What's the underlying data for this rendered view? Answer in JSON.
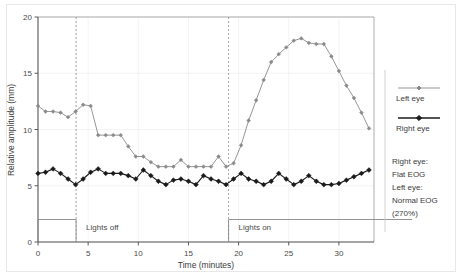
{
  "chart_data": {
    "type": "line",
    "title": "",
    "xlabel": "Time (minutes)",
    "ylabel": "Relative amplitude (mm)",
    "xlim": [
      0,
      33.5
    ],
    "ylim": [
      0,
      20
    ],
    "xticks": [
      0,
      5,
      10,
      15,
      20,
      25,
      30
    ],
    "yticks": [
      0,
      5,
      10,
      15,
      20
    ],
    "grid": true,
    "legend_position": "right",
    "series": [
      {
        "name": "Left eye",
        "color": "#8a8a8a",
        "marker": "diamond",
        "x": [
          0,
          0.75,
          1.5,
          2.25,
          3,
          3.75,
          4.5,
          5.25,
          6,
          6.75,
          7.5,
          8.25,
          9,
          9.75,
          10.5,
          11.25,
          12,
          12.75,
          13.5,
          14.25,
          15,
          15.75,
          16.5,
          17.25,
          18,
          18.75,
          19.5,
          20.25,
          21,
          21.75,
          22.5,
          23.25,
          24,
          24.75,
          25.5,
          26.25,
          27,
          27.75,
          28.5,
          29.25,
          30,
          30.75,
          31.5,
          32.25,
          33
        ],
        "y": [
          12.1,
          11.6,
          11.6,
          11.5,
          11.1,
          11.6,
          12.2,
          12.1,
          9.5,
          9.5,
          9.5,
          9.5,
          8.5,
          7.6,
          7.6,
          7.1,
          6.7,
          6.7,
          6.7,
          7.3,
          6.7,
          6.7,
          6.7,
          6.7,
          7.6,
          6.7,
          7.0,
          8.6,
          10.8,
          12.6,
          14.4,
          16.0,
          16.7,
          17.3,
          17.9,
          18.1,
          17.7,
          17.6,
          17.6,
          16.5,
          15.2,
          13.9,
          12.8,
          11.5,
          10.1
        ]
      },
      {
        "name": "Right eye",
        "color": "#1a1a1a",
        "marker": "diamond",
        "x": [
          0,
          0.75,
          1.5,
          2.25,
          3,
          3.75,
          4.5,
          5.25,
          6,
          6.75,
          7.5,
          8.25,
          9,
          9.75,
          10.5,
          11.25,
          12,
          12.75,
          13.5,
          14.25,
          15,
          15.75,
          16.5,
          17.25,
          18,
          18.75,
          19.5,
          20.25,
          21,
          21.75,
          22.5,
          23.25,
          24,
          24.75,
          25.5,
          26.25,
          27,
          27.75,
          28.5,
          29.25,
          30,
          30.75,
          31.5,
          32.25,
          33
        ],
        "y": [
          6.1,
          6.2,
          6.5,
          6.1,
          5.6,
          5.1,
          5.6,
          6.2,
          6.5,
          6.1,
          6.1,
          6.1,
          5.9,
          5.6,
          6.4,
          5.9,
          5.4,
          5.1,
          5.5,
          5.6,
          5.4,
          5.1,
          5.9,
          5.6,
          5.4,
          5.1,
          5.6,
          6.1,
          5.6,
          5.4,
          5.1,
          5.4,
          6.1,
          5.6,
          5.1,
          5.4,
          5.9,
          5.4,
          5.1,
          5.1,
          5.2,
          5.5,
          5.8,
          6.1,
          6.4
        ]
      }
    ],
    "annotations": [
      {
        "name": "lights-off",
        "label": "Lights off",
        "x_start": 0,
        "x_end": 3.8,
        "marker_line_x": 3.8
      },
      {
        "name": "lights-on",
        "label": "Lights on",
        "x_start": 19,
        "x_end": 33.5,
        "marker_line_x": 19
      }
    ],
    "notes": [
      "Right eye:",
      "Flat EOG",
      "Left eye:",
      "Normal EOG",
      "(270%)"
    ]
  },
  "legend": {
    "entries": [
      {
        "label": "Left eye",
        "color": "#8a8a8a"
      },
      {
        "label": "Right eye",
        "color": "#1a1a1a"
      }
    ]
  }
}
